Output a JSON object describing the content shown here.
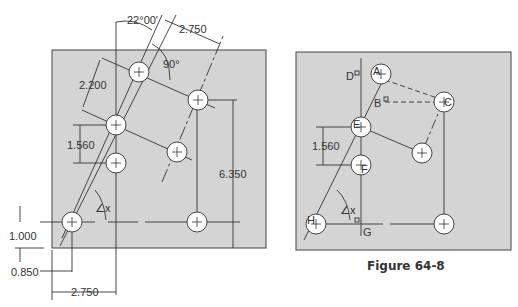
{
  "figure": {
    "caption": "Figure 64-8",
    "colors": {
      "plate": "#d4d4d4",
      "line": "#333333",
      "hole": "#ffffff"
    }
  },
  "left_drawing": {
    "dimensions": {
      "angle_top": "22°00'",
      "spacing_top": "2.750",
      "right_angle": "90°",
      "row_spacing": "2.200",
      "vertical_offset": "1.560",
      "height_total": "6.350",
      "bottom_offset": "1.000",
      "left_offset": "0.850",
      "bottom_spacing": "2.750",
      "angle_x": "∠x"
    }
  },
  "right_drawing": {
    "labels": {
      "A": "A",
      "B": "B",
      "C": "C",
      "D": "D",
      "E": "E",
      "F": "F",
      "G": "G",
      "H": "H"
    },
    "dimensions": {
      "vertical_offset": "1.560",
      "angle_x": "∠x"
    }
  }
}
